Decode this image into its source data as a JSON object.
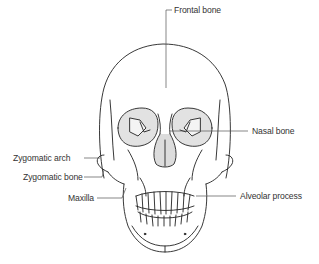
{
  "diagram": {
    "labels": {
      "frontal_bone": "Frontal bone",
      "nasal_bone": "Nasal bone",
      "zygomatic_arch": "Zygomatic arch",
      "zygomatic_bone": "Zygomatic bone",
      "maxilla": "Maxilla",
      "alveolar_process": "Alveolar process"
    },
    "colors": {
      "line": "#222222",
      "leader": "#555555",
      "text": "#333333",
      "shading": "#d9d9d9"
    }
  }
}
